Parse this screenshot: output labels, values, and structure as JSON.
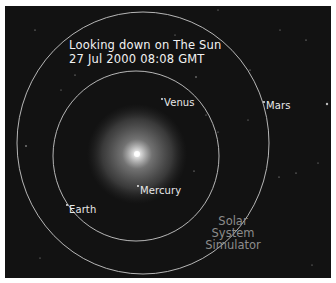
{
  "header": {
    "line1": "Looking down on The Sun",
    "line2": "27 Jul 2000 08:08 GMT"
  },
  "planets": [
    {
      "name": "Venus",
      "label": "Venus"
    },
    {
      "name": "Mars",
      "label": "Mars"
    },
    {
      "name": "Mercury",
      "label": "Mercury"
    },
    {
      "name": "Earth",
      "label": "Earth"
    }
  ],
  "watermark": {
    "line1": "Solar",
    "line2": "System",
    "line3": "Simulator"
  },
  "colors": {
    "background": "#121212",
    "orbit": "#c8c8c8",
    "text": "#f2f2f2",
    "watermark": "#8c8c8c",
    "sun_core": "#ffffff"
  }
}
